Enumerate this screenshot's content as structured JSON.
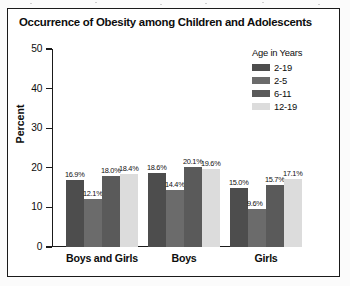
{
  "chart_data": {
    "type": "bar",
    "title": "Occurrence of Obesity among Children and Adolescents",
    "xlabel": "",
    "ylabel": "Percent",
    "categories": [
      "Boys and Girls",
      "Boys",
      "Girls"
    ],
    "ylim": [
      0,
      50
    ],
    "yticks": [
      0,
      10,
      20,
      30,
      40,
      50
    ],
    "ytick_labels": [
      "0",
      "10",
      "20",
      "30",
      "40",
      "50"
    ],
    "grid": false,
    "legend_title": "Age in Years",
    "legend_position": "top-right",
    "data_labels": true,
    "series": [
      {
        "name": "2-19",
        "color": "#4d4d4d",
        "values": [
          16.9,
          18.6,
          15.0
        ],
        "labels": [
          "16.9%",
          "18.6%",
          "15.0%"
        ]
      },
      {
        "name": "2-5",
        "color": "#6b6b6b",
        "values": [
          12.1,
          14.4,
          9.6
        ],
        "labels": [
          "12.1%",
          "14.4%",
          "9.6%"
        ]
      },
      {
        "name": "6-11",
        "color": "#5a5a5a",
        "values": [
          18.0,
          20.1,
          15.7
        ],
        "labels": [
          "18.0%",
          "20.1%",
          "15.7%"
        ]
      },
      {
        "name": "12-19",
        "color": "#dcdcdc",
        "values": [
          18.4,
          19.6,
          17.1
        ],
        "labels": [
          "18.4%",
          "19.6%",
          "17.1%"
        ]
      }
    ]
  },
  "colors": {
    "frame": "#1a1a1a",
    "background": "#ffffff",
    "text": "#0d0d0d"
  }
}
